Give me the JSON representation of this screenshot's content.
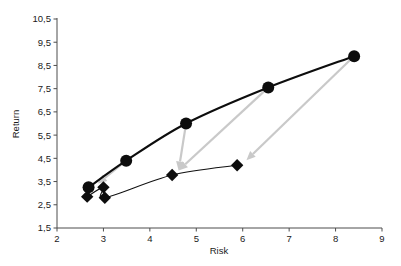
{
  "chart_data": {
    "type": "scatter",
    "title": "",
    "subtitle": "",
    "xlabel": "Risk",
    "ylabel": "Return",
    "xlim": [
      2,
      9
    ],
    "ylim": [
      1.5,
      10.5
    ],
    "xticks": [
      "2",
      "3",
      "4",
      "5",
      "6",
      "7",
      "8",
      "9"
    ],
    "xtick_values": [
      2,
      3,
      4,
      5,
      6,
      7,
      8,
      9
    ],
    "yticks": [
      "1,5",
      "2,5",
      "3,5",
      "4,5",
      "5,5",
      "6,5",
      "7,5",
      "8,5",
      "9,5",
      "10,5"
    ],
    "ytick_values": [
      1.5,
      2.5,
      3.5,
      4.5,
      5.5,
      6.5,
      7.5,
      8.5,
      9.5,
      10.5
    ],
    "grid": false,
    "legend": "none",
    "decimal_separator": ",",
    "series": [
      {
        "name": "circle-series",
        "marker": "circle",
        "color": "#0d0d0d",
        "line_width": 2.1,
        "points": [
          {
            "x": 2.68,
            "y": 3.25
          },
          {
            "x": 3.49,
            "y": 4.4
          },
          {
            "x": 4.78,
            "y": 6.0
          },
          {
            "x": 6.55,
            "y": 7.55
          },
          {
            "x": 8.4,
            "y": 8.9
          }
        ]
      },
      {
        "name": "diamond-series",
        "marker": "diamond",
        "color": "#0d0d0d",
        "line_width": 1.1,
        "points": [
          {
            "x": 2.65,
            "y": 2.85
          },
          {
            "x": 3.0,
            "y": 3.25
          },
          {
            "x": 3.03,
            "y": 2.8
          },
          {
            "x": 4.48,
            "y": 3.78
          },
          {
            "x": 5.88,
            "y": 4.2
          }
        ]
      }
    ],
    "annotations": [
      {
        "type": "arrow",
        "color": "#c9c9c9",
        "from": {
          "x": 3.49,
          "y": 4.4
        },
        "to": {
          "x": 2.88,
          "y": 3.42
        }
      },
      {
        "type": "arrow",
        "color": "#c9c9c9",
        "from": {
          "x": 4.78,
          "y": 6.0
        },
        "to": {
          "x": 4.62,
          "y": 3.98
        }
      },
      {
        "type": "arrow",
        "color": "#c9c9c9",
        "from": {
          "x": 6.55,
          "y": 7.55
        },
        "to": {
          "x": 4.62,
          "y": 3.98
        }
      },
      {
        "type": "arrow",
        "color": "#c9c9c9",
        "from": {
          "x": 8.4,
          "y": 8.9
        },
        "to": {
          "x": 6.08,
          "y": 4.42
        }
      }
    ]
  },
  "axes": {
    "x_title": "Risk",
    "y_title": "Return"
  }
}
